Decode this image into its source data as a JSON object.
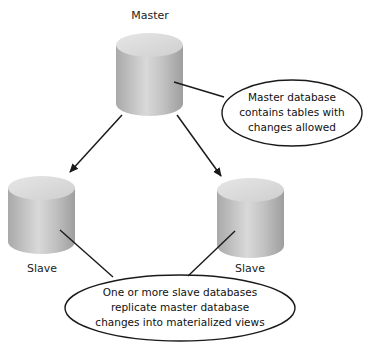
{
  "nodes": {
    "master": {
      "label": "Master"
    },
    "slave_left": {
      "label": "Slave"
    },
    "slave_right": {
      "label": "Slave"
    }
  },
  "callouts": {
    "master": {
      "lines": [
        "Master database",
        "contains tables with",
        "changes allowed"
      ]
    },
    "slaves": {
      "lines": [
        "One or more slave databases",
        "replicate master database",
        "changes into materialized views"
      ]
    }
  },
  "colors": {
    "cylinder_light": "#e8e8e8",
    "cylinder_mid": "#bdbdbd",
    "cylinder_dark": "#9a9a9a",
    "line": "#1a1a1a"
  }
}
